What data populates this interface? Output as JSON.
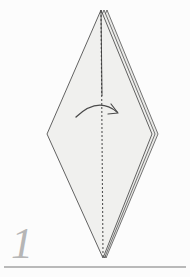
{
  "figure": {
    "kind": "origami-fold-instruction",
    "step_label": "1",
    "background_color": "#fcfcfc",
    "paper_fill": "#f0f0ee",
    "paper_fill_shaded": "#e9e9e7",
    "outline_color": "#3c3c3c",
    "fold_line_color": "#555555",
    "arrow_color": "#4a4a4a",
    "step_number_color": "#b6b6b6",
    "rule_color": "#b9b9b9"
  },
  "shape": {
    "name": "kite-diamond",
    "description": "Tall diamond (kite) seen from the front with folded layers stacked at the right edge",
    "vertices": {
      "top": [
        101,
        10
      ],
      "left": [
        47,
        134
      ],
      "right": [
        152,
        134
      ],
      "bottom": [
        103,
        258
      ]
    },
    "layer_offsets": [
      0,
      3,
      6
    ],
    "layer_count": 3
  },
  "fold_line": {
    "name": "valley-fold-center-line",
    "style": "dashed",
    "from": [
      101,
      10
    ],
    "to": [
      103,
      258
    ],
    "dash": "2 2"
  },
  "arrow": {
    "name": "fold-over-arrow",
    "type": "curved",
    "direction": "left-to-right-over-center",
    "start": [
      76,
      117
    ],
    "control": [
      98,
      98
    ],
    "end": [
      118,
      113
    ],
    "head_at": [
      118,
      113
    ]
  },
  "baseline_rule": {
    "name": "bottom-divider",
    "y": 267,
    "x_start": 4,
    "x_end": 186,
    "thickness": 2
  }
}
